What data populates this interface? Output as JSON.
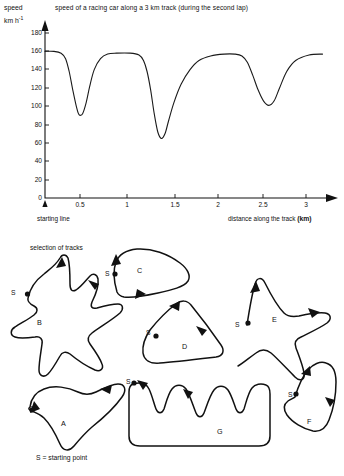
{
  "chart": {
    "title": "speed of a racing car along a 3 km track   (during the second lap)",
    "ylabel_line1": "speed",
    "ylabel_line2": "km h",
    "ylabel_exponent": "-1",
    "xlabel": "distance along the track",
    "xlabel_unit": "(km)",
    "starting_line_label": "starting line",
    "yticks": [
      "180",
      "160",
      "140",
      "120",
      "100",
      "80",
      "60",
      "40",
      "20",
      "0"
    ],
    "xticks": [
      "0.5",
      "1",
      "1.5",
      "2",
      "2.5",
      "3"
    ]
  },
  "chart_data": {
    "type": "line",
    "title": "speed of a racing car along a 3 km track   (during the second lap)",
    "xlabel": "distance along the track (km)",
    "ylabel": "speed km h^-1",
    "xlim": [
      0,
      3.15
    ],
    "ylim": [
      0,
      190
    ],
    "xticks": [
      0.5,
      1,
      1.5,
      2,
      2.5,
      3
    ],
    "yticks": [
      0,
      20,
      40,
      60,
      80,
      100,
      120,
      140,
      160,
      180
    ],
    "grid": false,
    "legend": "none",
    "annotations": [
      "starting line"
    ],
    "series": [
      {
        "name": "speed",
        "x": [
          0.0,
          0.1,
          0.18,
          0.23,
          0.27,
          0.31,
          0.35,
          0.38,
          0.42,
          0.46,
          0.5,
          0.55,
          0.62,
          0.7,
          0.8,
          0.95,
          1.05,
          1.1,
          1.14,
          1.18,
          1.22,
          1.26,
          1.3,
          1.34,
          1.38,
          1.44,
          1.52,
          1.62,
          1.72,
          1.85,
          2.0,
          2.12,
          2.2,
          2.26,
          2.32,
          2.38,
          2.44,
          2.5,
          2.56,
          2.62,
          2.7,
          2.8,
          2.95,
          3.1
        ],
        "y": [
          160,
          160,
          158,
          152,
          138,
          118,
          100,
          91,
          92,
          104,
          122,
          140,
          152,
          157,
          158,
          158,
          156,
          150,
          138,
          118,
          92,
          72,
          65,
          70,
          84,
          104,
          124,
          140,
          150,
          155,
          157,
          157,
          155,
          148,
          134,
          118,
          106,
          101,
          106,
          120,
          138,
          150,
          156,
          157
        ]
      }
    ]
  },
  "tracks": {
    "caption": "selection of tracks",
    "legend": "S = starting point",
    "start_marker_label": "S",
    "items": [
      {
        "id": "A",
        "label": "A"
      },
      {
        "id": "B",
        "label": "B"
      },
      {
        "id": "C",
        "label": "C"
      },
      {
        "id": "D",
        "label": "D"
      },
      {
        "id": "E",
        "label": "E"
      },
      {
        "id": "F",
        "label": "F"
      },
      {
        "id": "G",
        "label": "G"
      }
    ]
  }
}
